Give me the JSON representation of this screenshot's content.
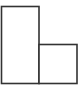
{
  "diagram": {
    "stroke_color": "#333333",
    "fill_color": "#ffffff",
    "stroke_width": 1.6,
    "shapes": [
      {
        "id": "tall-rectangle",
        "x": 1.5,
        "y": 6.5,
        "width": 37.5,
        "height": 77
      },
      {
        "id": "short-square",
        "x": 39,
        "y": 44.5,
        "width": 38,
        "height": 39
      }
    ]
  }
}
